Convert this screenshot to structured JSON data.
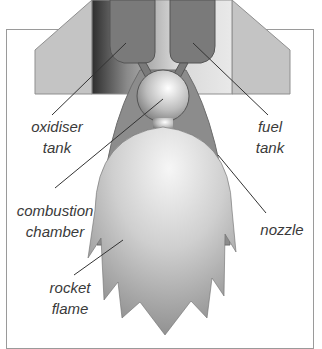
{
  "diagram": {
    "labels": {
      "oxidiser_tank": [
        "oxidiser",
        "tank"
      ],
      "fuel_tank": [
        "fuel",
        "tank"
      ],
      "combustion_chamber": [
        "combustion",
        "chamber"
      ],
      "nozzle": [
        "nozzle"
      ],
      "rocket_flame": [
        "rocket",
        "flame"
      ]
    },
    "colors": {
      "fin": "#c4c4c4",
      "tank": "#7a7a7a",
      "nozzle": "#8c8c8c",
      "flame_light": "#f2f2f2",
      "flame_dark": "#8e8e8e",
      "leader_line": "#333333",
      "frame": "#9a9a9a"
    }
  }
}
